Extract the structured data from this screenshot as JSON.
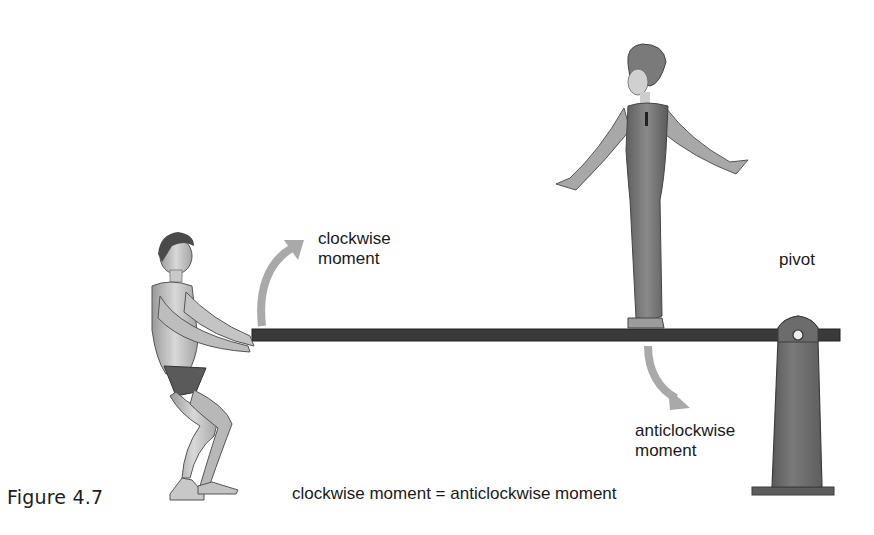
{
  "figure": {
    "caption": "Figure 4.7",
    "labels": {
      "clockwise": [
        "clockwise",
        "moment"
      ],
      "anticlockwise": [
        "anticlockwise",
        "moment"
      ],
      "pivot": "pivot",
      "equation": "clockwise moment = anticlockwise moment"
    },
    "elements": {
      "person_left": "man pulling down on beam",
      "person_right": "woman standing on beam",
      "beam": "horizontal lever beam",
      "pivot_post": "pivot support post"
    },
    "colors": {
      "arrow": "#a9a9a9",
      "beam": "#3a3a3a",
      "post": "#6f6f6f",
      "text": "#1a1a1a"
    }
  }
}
